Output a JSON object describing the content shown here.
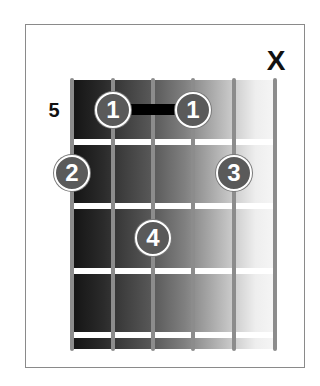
{
  "diagram": {
    "type": "guitar-chord-diagram",
    "start_fret_label": "5",
    "strings": 6,
    "frets_shown": 4,
    "muted_strings": [
      {
        "string": 6,
        "label": "X"
      }
    ],
    "barre": {
      "from_string": 2,
      "to_string": 4,
      "fret": 1,
      "finger": "1"
    },
    "fingers": [
      {
        "string": 2,
        "fret": 1,
        "label": "1"
      },
      {
        "string": 4,
        "fret": 1,
        "label": "1"
      },
      {
        "string": 1,
        "fret": 2,
        "label": "2"
      },
      {
        "string": 5,
        "fret": 2,
        "label": "3"
      },
      {
        "string": 3,
        "fret": 3,
        "label": "4"
      }
    ],
    "colors": {
      "board_dark": "#141414",
      "board_light": "#f6f6f6",
      "string": "#8c8c8c",
      "fret": "#ffffff",
      "finger_fill": "#5a5a5a",
      "finger_text": "#ffffff",
      "barre": "#000000",
      "frame_border": "#8a8a8a"
    }
  }
}
